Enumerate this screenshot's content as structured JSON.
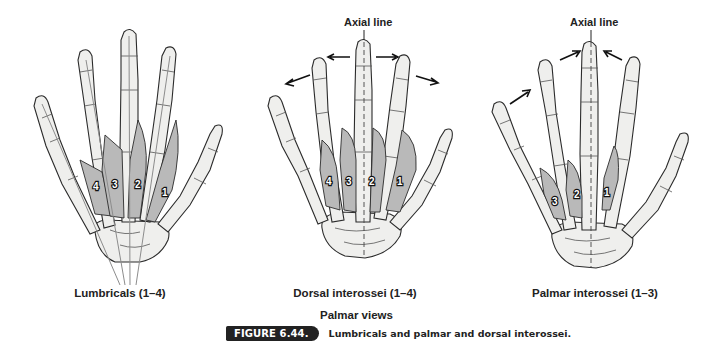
{
  "figure": {
    "panels": [
      {
        "id": "lumbricals",
        "caption": "Lumbricals (1–4)",
        "muscle_labels": [
          "4",
          "3",
          "2",
          "1"
        ],
        "axial_label": null
      },
      {
        "id": "dorsal-interossei",
        "caption": "Dorsal interossei (1–4)",
        "muscle_labels": [
          "4",
          "3",
          "2",
          "1"
        ],
        "axial_label": "Axial line",
        "arrows": "abduction (away from axial line)"
      },
      {
        "id": "palmar-interossei",
        "caption": "Palmar interossei (1–3)",
        "muscle_labels": [
          "3",
          "2",
          "1"
        ],
        "axial_label": "Axial line",
        "arrows": "adduction (toward axial line)"
      }
    ],
    "subtitle": "Palmar views",
    "badge": "FIGURE 6.44.",
    "caption": "Lumbricals and palmar and dorsal interossei.",
    "colors": {
      "badge_bg": "#222222",
      "badge_text": "#ffffff",
      "bone_fill": "#efefed",
      "muscle_fill": "#b9b9b9"
    }
  }
}
